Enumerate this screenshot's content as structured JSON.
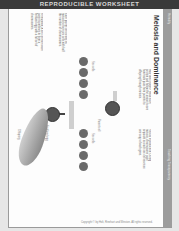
{
  "banner": {
    "text": "REPRODUCIBLE WORKSHEET"
  },
  "worksheet": {
    "section_label": "Heredity",
    "title": "Meiosis and Dominance",
    "sidebar_label": "Teaching Transparency",
    "paragraphs": [
      {
        "id": "intro-left",
        "text": "How does it work? Read each section and follow the arrows to see how traits pass from parents to offspring through meiosis."
      },
      {
        "id": "intro-right",
        "text": "Sexual reproduction: During meiosis, chromosome pairs separate so each sex cell receives one copy of each gene."
      },
      {
        "id": "step-a",
        "text": "Each parent cell divides by meiosis to form sex cells with half the number of chromosomes."
      },
      {
        "id": "step-b",
        "text": "Fertilization: A sex cell from each parent combines to form a fertilized egg with a full set of chromosomes."
      }
    ],
    "labels": [
      "Sex cells",
      "Sex cells",
      "Fertilized egg",
      "Parent cell",
      "Offspring"
    ],
    "copyright": "Copyright © by Holt, Rinehart and Winston. All rights reserved."
  },
  "colors": {
    "banner": "#3a3a3a",
    "strip": "#9c9c9c",
    "cell": "#6a6a6a",
    "page": "#fdfdfd"
  }
}
